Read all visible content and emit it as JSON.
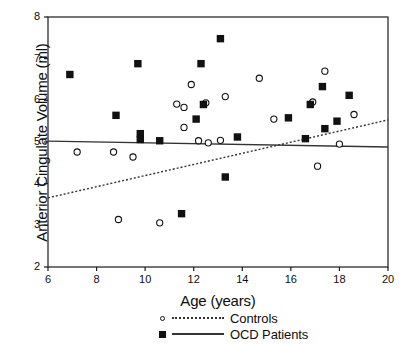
{
  "chart_data": {
    "type": "scatter",
    "title": "",
    "xlabel": "Age (years)",
    "ylabel": "Anterior Cingulate Volume (ml)",
    "xlim": [
      6,
      20
    ],
    "ylim": [
      2,
      8
    ],
    "xticks": [
      6,
      8,
      10,
      12,
      14,
      16,
      18,
      20
    ],
    "yticks": [
      2,
      3,
      4,
      5,
      6,
      7,
      8
    ],
    "grid": false,
    "legend_position": "below-axes",
    "series": [
      {
        "name": "Controls",
        "marker": "open-circle",
        "line_style": "dotted",
        "points": [
          [
            7.2,
            4.76
          ],
          [
            8.7,
            4.76
          ],
          [
            8.9,
            3.14
          ],
          [
            9.5,
            4.64
          ],
          [
            10.6,
            3.06
          ],
          [
            11.3,
            5.91
          ],
          [
            11.6,
            5.83
          ],
          [
            11.6,
            5.35
          ],
          [
            11.9,
            6.38
          ],
          [
            12.5,
            5.94
          ],
          [
            12.2,
            5.03
          ],
          [
            12.6,
            4.98
          ],
          [
            13.3,
            6.09
          ],
          [
            13.1,
            5.04
          ],
          [
            14.7,
            6.53
          ],
          [
            15.3,
            5.55
          ],
          [
            16.9,
            5.96
          ],
          [
            17.4,
            6.7
          ],
          [
            18.0,
            4.95
          ],
          [
            18.6,
            5.66
          ],
          [
            17.1,
            4.42
          ]
        ],
        "fit_line": {
          "x": [
            6,
            20
          ],
          "y": [
            3.66,
            5.53
          ]
        }
      },
      {
        "name": "OCD Patients",
        "marker": "filled-square",
        "line_style": "solid",
        "points": [
          [
            6.9,
            6.62
          ],
          [
            8.8,
            5.64
          ],
          [
            9.7,
            6.88
          ],
          [
            9.8,
            5.2
          ],
          [
            9.8,
            5.06
          ],
          [
            10.6,
            5.03
          ],
          [
            11.5,
            3.28
          ],
          [
            12.3,
            6.88
          ],
          [
            12.1,
            5.55
          ],
          [
            12.4,
            5.9
          ],
          [
            13.1,
            7.48
          ],
          [
            13.3,
            4.16
          ],
          [
            13.8,
            5.12
          ],
          [
            15.9,
            5.58
          ],
          [
            16.8,
            5.9
          ],
          [
            17.3,
            6.33
          ],
          [
            17.4,
            5.32
          ],
          [
            16.6,
            5.08
          ],
          [
            18.4,
            6.12
          ],
          [
            17.9,
            5.5
          ]
        ],
        "fit_line": {
          "x": [
            6,
            20
          ],
          "y": [
            5.02,
            4.88
          ]
        }
      }
    ]
  },
  "legend": {
    "items": [
      {
        "label": "Controls",
        "marker": "open-circle",
        "line": "dotted"
      },
      {
        "label": "OCD Patients",
        "marker": "filled-square",
        "line": "solid"
      }
    ]
  },
  "colors": {
    "axis": "#1a1a1a",
    "marker": "#111111",
    "fit_solid": "#333333",
    "fit_dotted": "#333333",
    "background": "#ffffff"
  }
}
